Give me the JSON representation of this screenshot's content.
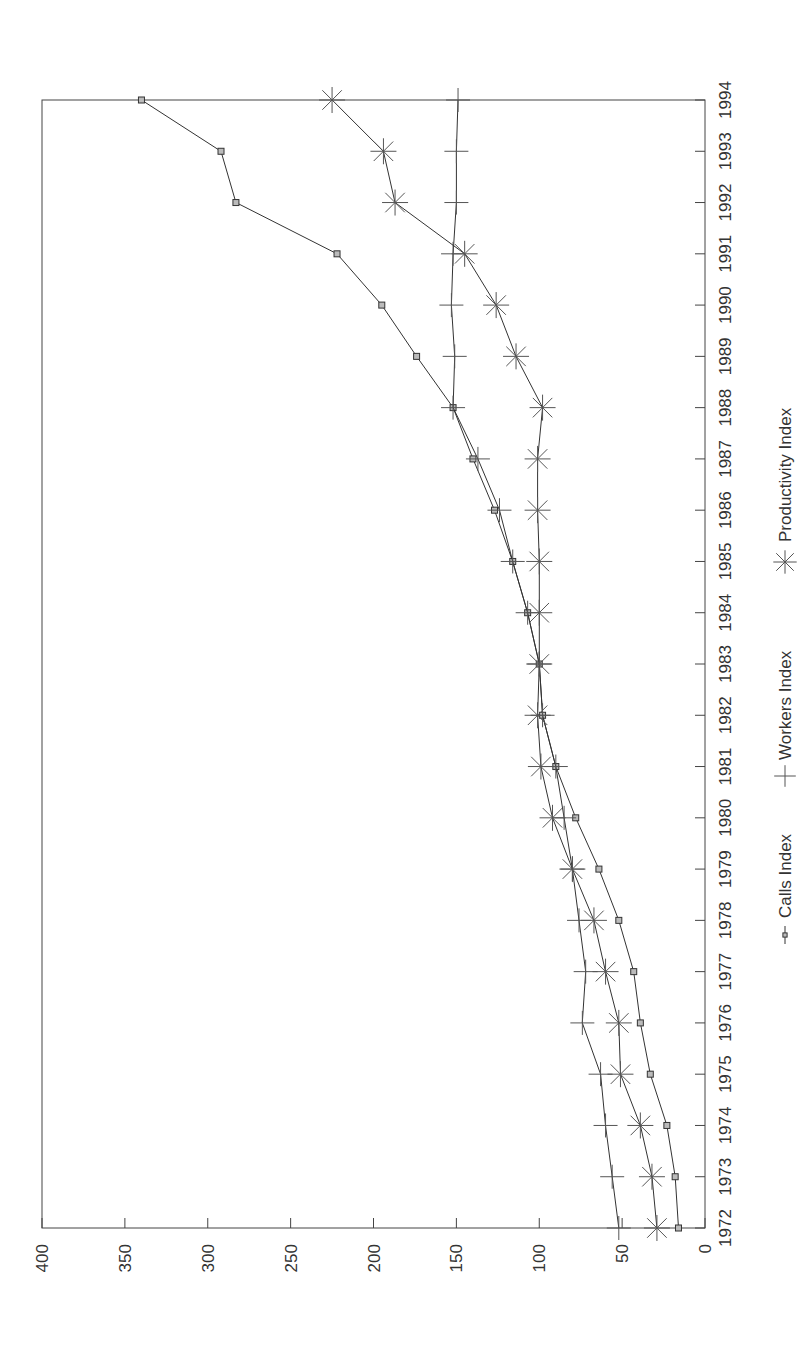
{
  "chart_data": {
    "type": "line",
    "orientation": "rotated-90-clockwise",
    "title": "",
    "xlabel": "",
    "ylabel": "",
    "x": [
      1972,
      1973,
      1974,
      1975,
      1976,
      1977,
      1978,
      1979,
      1980,
      1981,
      1982,
      1983,
      1984,
      1985,
      1986,
      1987,
      1988,
      1989,
      1990,
      1991,
      1992,
      1993,
      1994
    ],
    "x_tick_labels": [
      "1972",
      "1973",
      "1974",
      "1975",
      "1976",
      "1977",
      "1978",
      "1979",
      "1980",
      "1981",
      "1982",
      "1983",
      "1984",
      "1985",
      "1986",
      "1987",
      "1988",
      "1989",
      "1990",
      "1991",
      "1992",
      "1993",
      "1994"
    ],
    "ylim": [
      0,
      400
    ],
    "y_ticks": [
      0,
      50,
      100,
      150,
      200,
      250,
      300,
      350,
      400
    ],
    "y_tick_labels": [
      "0",
      "50",
      "100",
      "150",
      "200",
      "250",
      "300",
      "350",
      "400"
    ],
    "grid": false,
    "legend_position": "bottom",
    "series": [
      {
        "name": "Calls Index",
        "marker": "square",
        "values": [
          16,
          18,
          23,
          33,
          39,
          43,
          52,
          64,
          78,
          90,
          98,
          100,
          107,
          116,
          127,
          140,
          152,
          174,
          195,
          222,
          283,
          292,
          340
        ]
      },
      {
        "name": "Workers Index",
        "marker": "plus",
        "values": [
          52,
          56,
          60,
          63,
          74,
          72,
          76,
          80,
          85,
          90,
          98,
          100,
          107,
          116,
          124,
          137,
          152,
          151,
          153,
          152,
          150,
          150,
          149
        ]
      },
      {
        "name": "Productivity Index",
        "marker": "asterisk",
        "values": [
          29,
          32,
          39,
          51,
          52,
          60,
          67,
          80,
          92,
          99,
          101,
          100,
          100,
          100,
          101,
          101,
          98,
          114,
          126,
          145,
          187,
          194,
          225
        ]
      }
    ]
  },
  "legend": {
    "items": [
      {
        "label": "Calls Index",
        "icon": "square-marker-icon"
      },
      {
        "label": "Workers Index",
        "icon": "plus-marker-icon"
      },
      {
        "label": "Productivity Index",
        "icon": "asterisk-marker-icon"
      }
    ]
  },
  "colors": {
    "line": "#333333",
    "marker": "#555555",
    "frame": "#444444",
    "background": "#ffffff"
  }
}
